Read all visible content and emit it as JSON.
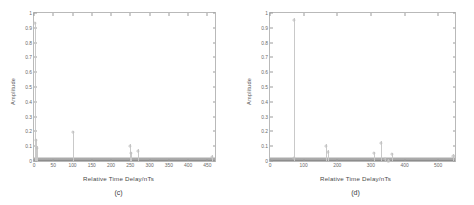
{
  "figure": {
    "background": "#ffffff",
    "axis_color": "#b9b9b9",
    "data_color": "#c2c2c2",
    "noise_color": "#8d8d8d"
  },
  "chart_data": [
    {
      "type": "scatter",
      "panel_label": "(c)",
      "title": "",
      "xlabel": "Relative Time Delay/nTs",
      "ylabel": "Amplitude",
      "xlim": [
        0,
        470
      ],
      "ylim": [
        0,
        1
      ],
      "xticks": [
        0,
        50,
        100,
        150,
        200,
        250,
        300,
        350,
        400,
        450
      ],
      "yticks": [
        0,
        0.1,
        0.2,
        0.3,
        0.4,
        0.5,
        0.6,
        0.7,
        0.8,
        0.9,
        1
      ],
      "grid": false,
      "legend": null,
      "noise_floor": 0.012,
      "x": [
        3,
        5,
        7,
        100,
        250,
        252,
        270,
        462
      ],
      "values": [
        0.94,
        0.15,
        0.1,
        0.205,
        0.112,
        0.062,
        0.078,
        0.04
      ],
      "stems": [
        {
          "x": 3,
          "y": 0.94
        },
        {
          "x": 5,
          "y": 0.15
        },
        {
          "x": 7,
          "y": 0.1
        },
        {
          "x": 100,
          "y": 0.205
        },
        {
          "x": 250,
          "y": 0.112
        },
        {
          "x": 252,
          "y": 0.062
        },
        {
          "x": 270,
          "y": 0.078
        },
        {
          "x": 462,
          "y": 0.04
        }
      ]
    },
    {
      "type": "scatter",
      "panel_label": "(d)",
      "title": "",
      "xlabel": "Relative Time Delay/nTs",
      "ylabel": "Amplitude",
      "xlim": [
        0,
        550
      ],
      "ylim": [
        0,
        1
      ],
      "xticks": [
        0,
        100,
        200,
        300,
        400,
        500
      ],
      "yticks": [
        0,
        0.1,
        0.2,
        0.3,
        0.4,
        0.5,
        0.6,
        0.7,
        0.8,
        0.9,
        1
      ],
      "grid": false,
      "legend": null,
      "noise_floor": 0.012,
      "x": [
        70,
        72,
        165,
        172,
        310,
        330,
        342,
        352,
        362,
        545
      ],
      "values": [
        0.965,
        0.028,
        0.112,
        0.072,
        0.062,
        0.132,
        0.022,
        0.012,
        0.055,
        0.045
      ],
      "stems": [
        {
          "x": 70,
          "y": 0.965
        },
        {
          "x": 72,
          "y": 0.028
        },
        {
          "x": 165,
          "y": 0.112
        },
        {
          "x": 172,
          "y": 0.072
        },
        {
          "x": 310,
          "y": 0.062
        },
        {
          "x": 330,
          "y": 0.132
        },
        {
          "x": 342,
          "y": 0.022
        },
        {
          "x": 352,
          "y": 0.012
        },
        {
          "x": 362,
          "y": 0.055
        },
        {
          "x": 545,
          "y": 0.045
        }
      ]
    }
  ]
}
